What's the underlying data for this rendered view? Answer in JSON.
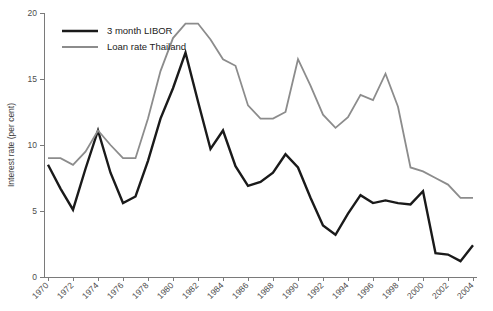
{
  "chart_data": {
    "type": "line",
    "title": "",
    "xlabel": "",
    "ylabel": "Interest rate (per cent)",
    "xlim": [
      1970,
      2004
    ],
    "ylim": [
      0,
      20
    ],
    "grid": false,
    "legend_position": "top-left",
    "x_tick_labels": [
      "1970",
      "1972",
      "1974",
      "1976",
      "1978",
      "1980",
      "1982",
      "1984",
      "1986",
      "1988",
      "1990",
      "1992",
      "1994",
      "1996",
      "1998",
      "2000",
      "2002",
      "2004"
    ],
    "y_tick_labels": [
      "0",
      "5",
      "10",
      "15",
      "20"
    ],
    "y_ticks": [
      0,
      5,
      10,
      15,
      20
    ],
    "x": [
      1970,
      1971,
      1972,
      1973,
      1974,
      1975,
      1976,
      1977,
      1978,
      1979,
      1980,
      1981,
      1982,
      1983,
      1984,
      1985,
      1986,
      1987,
      1988,
      1989,
      1990,
      1991,
      1992,
      1993,
      1994,
      1995,
      1996,
      1997,
      1998,
      1999,
      2000,
      2001,
      2002,
      2003,
      2004
    ],
    "series": [
      {
        "name": "3 month LIBOR",
        "color": "#1a1a1a",
        "values": [
          8.5,
          6.7,
          5.1,
          8.2,
          11.1,
          7.9,
          5.6,
          6.1,
          8.8,
          12.0,
          14.3,
          17.0,
          13.3,
          9.7,
          11.1,
          8.4,
          6.9,
          7.2,
          7.9,
          9.3,
          8.3,
          6.0,
          3.9,
          3.2,
          4.8,
          6.2,
          5.6,
          5.8,
          5.6,
          5.5,
          6.5,
          1.8,
          1.7,
          1.2,
          2.4
        ]
      },
      {
        "name": "Loan rate Thailand",
        "color": "#8c8c8c",
        "values": [
          9.0,
          9.0,
          8.5,
          9.5,
          11.1,
          10.0,
          9.0,
          9.0,
          12.0,
          15.6,
          18.1,
          19.2,
          19.2,
          18.0,
          16.5,
          16.0,
          13.0,
          12.0,
          12.0,
          12.5,
          16.5,
          14.5,
          12.3,
          11.3,
          12.1,
          13.8,
          13.4,
          15.4,
          12.9,
          8.3,
          8.0,
          7.5,
          7.0,
          6.0,
          6.0
        ]
      }
    ]
  },
  "legend": {
    "items": [
      {
        "label": "3 month LIBOR",
        "color": "#1a1a1a",
        "width": 2.4
      },
      {
        "label": "Loan rate Thailand",
        "color": "#8c8c8c",
        "width": 1.8
      }
    ]
  }
}
